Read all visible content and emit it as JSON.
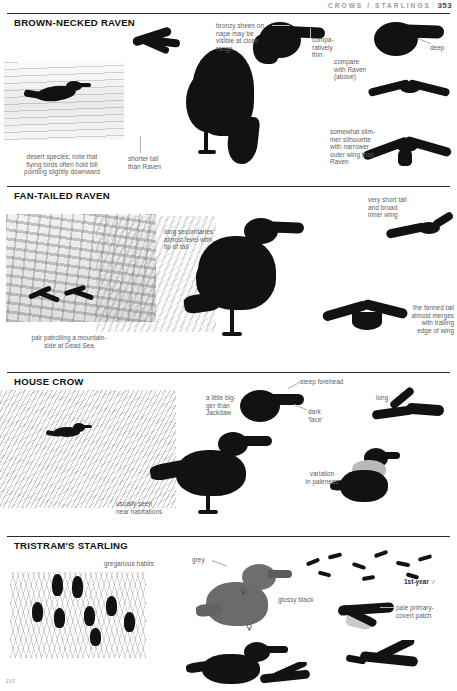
{
  "page": {
    "running_head": "CROWS / STARLINGS",
    "page_number": "353",
    "artist_signature": "DZ"
  },
  "sections": [
    {
      "id": "brown-necked-raven",
      "title": "BROWN-NECKED RAVEN",
      "annotations": [
        {
          "id": "bronzy-sheen",
          "text": "bronzy sheen on nape may be visible at close range"
        },
        {
          "id": "comparatively-thin",
          "text": "compa-\nratively\nthin"
        },
        {
          "id": "deep",
          "text": "deep"
        },
        {
          "id": "compare-with-raven",
          "text": "compare\nwith Raven\n(above)"
        },
        {
          "id": "slimmer-silhouette",
          "text": "somewhat slim-\nmer silhouette\nwith narrower\nouter wing than\nRaven"
        },
        {
          "id": "shorter-tail",
          "text": "shorter tail\nthan Raven"
        },
        {
          "id": "desert-species",
          "text": "desert species; note that\nflying birds often hold bill\npointing slightly downward"
        }
      ]
    },
    {
      "id": "fan-tailed-raven",
      "title": "FAN-TAILED RAVEN",
      "annotations": [
        {
          "id": "long-secondaries",
          "text": "long secondaries\nalmost level with\ntip of tail"
        },
        {
          "id": "very-short-tail",
          "text": "very short tail\nand broad\ninner wing"
        },
        {
          "id": "fanned-tail",
          "text": "the fanned tail\nalmost merges\nwith trailing\nedge of wing"
        },
        {
          "id": "pair-patrolling",
          "text": "pair patrolling a mountain-\nside at Dead Sea"
        }
      ]
    },
    {
      "id": "house-crow",
      "title": "HOUSE CROW",
      "annotations": [
        {
          "id": "a-little-bigger",
          "text": "a little big-\nger than\nJackdaw"
        },
        {
          "id": "steep-forehead",
          "text": "steep forehead"
        },
        {
          "id": "dark-face",
          "text": "dark\n'face'"
        },
        {
          "id": "long",
          "text": "long"
        },
        {
          "id": "variation-in-paleness",
          "text": "variation\nin paleness"
        },
        {
          "id": "usually-seen",
          "text": "usually seen\nnear habitations"
        }
      ]
    },
    {
      "id": "tristrams-starling",
      "title": "TRISTRAM'S STARLING",
      "annotations": [
        {
          "id": "gregarious-habits",
          "text": "gregarious habits"
        },
        {
          "id": "grey",
          "text": "grey"
        },
        {
          "id": "glossy-black",
          "text": "glossy black"
        },
        {
          "id": "first-year-male",
          "text": "1st-year ♂"
        },
        {
          "id": "pale-primary-covert",
          "text": "pale primary-\ncovert patch"
        },
        {
          "id": "female-symbol-1",
          "text": "♀"
        },
        {
          "id": "female-symbol-2",
          "text": "♀"
        }
      ]
    }
  ],
  "colors": {
    "rule": "#2b2b2b",
    "heading": "#111111",
    "annotation": "#5d5d5d",
    "running_head": "#9a9a9a",
    "ink": "#121212"
  }
}
